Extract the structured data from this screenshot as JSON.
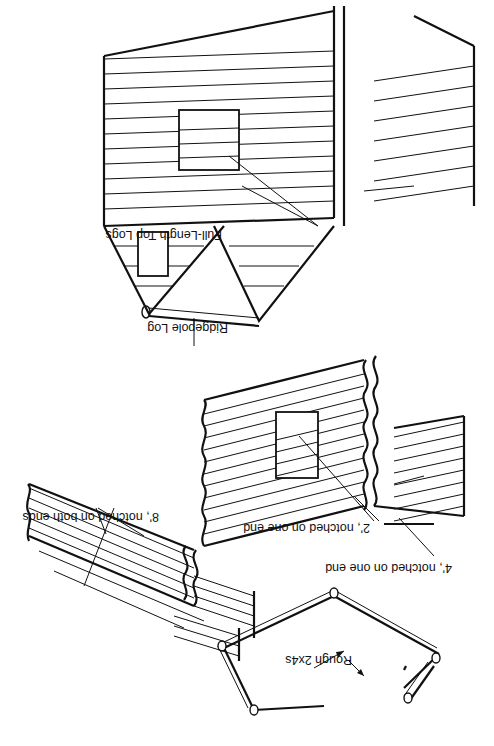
{
  "figure": {
    "orientation": "rotated 180 degrees",
    "stages": [
      {
        "id": "stage-1",
        "name": "Base frame"
      },
      {
        "id": "stage-2",
        "name": "First courses"
      },
      {
        "id": "stage-3",
        "name": "Walls with door opening"
      },
      {
        "id": "stage-4",
        "name": "Completed walls with gables"
      }
    ],
    "labels": {
      "rough_2x4s": "Rough 2x4s",
      "eight_ft": "8', notched on both ends",
      "four_ft": "4', notched on one end",
      "two_ft": "2', notched on one end",
      "ridgepole": "Ridgepole Log",
      "full_length_top": "Full-Length Top Logs"
    },
    "colors": {
      "ink": "#111111",
      "paper": "#ffffff"
    }
  }
}
